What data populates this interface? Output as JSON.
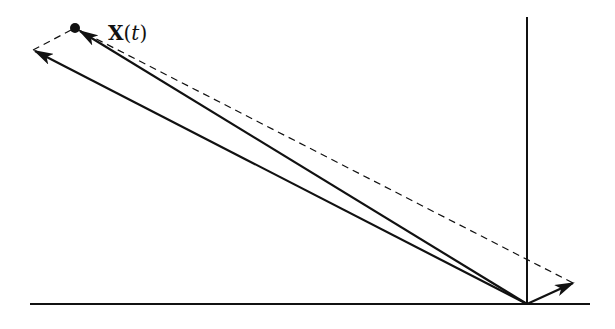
{
  "diagram": {
    "type": "vector-diagram",
    "label": {
      "symbol": "X",
      "arg_open": "(",
      "arg": "t",
      "arg_close": ")"
    },
    "colors": {
      "stroke": "#111111",
      "background": "#ffffff"
    },
    "geometry": {
      "origin": [
        527,
        304
      ],
      "horizontal_axis": {
        "x1": 30,
        "x2": 590,
        "y": 304
      },
      "vertical_axis": {
        "x": 527,
        "y1": 17,
        "y2": 304
      },
      "point_X": [
        75,
        28
      ],
      "vector_long": {
        "from": [
          527,
          304
        ],
        "to": [
          33,
          50
        ]
      },
      "vector_to_X": {
        "from": [
          527,
          304
        ],
        "to": [
          78,
          30
        ]
      },
      "vector_short": {
        "from": [
          527,
          304
        ],
        "to": [
          573,
          283
        ]
      },
      "dashed_parallelogram": [
        [
          33,
          50
        ],
        [
          75,
          28
        ],
        [
          573,
          283
        ]
      ]
    }
  }
}
